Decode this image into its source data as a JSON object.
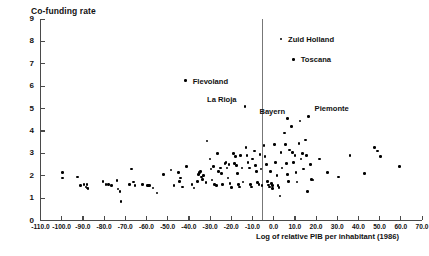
{
  "chart_data": {
    "type": "scatter",
    "title": "",
    "xlabel": "Log of relative PIB per inhabitant (1986)",
    "ylabel": "Co-funding rate",
    "xlim": [
      -110.0,
      70.0
    ],
    "ylim": [
      0,
      9
    ],
    "grid": false,
    "legend": null,
    "xticks": [
      "-110.0",
      "-100.0",
      "-90.0",
      "-80.0",
      "-70.0",
      "-60.0",
      "-50.0",
      "-40.0",
      "-30.0",
      "-20.0",
      "-10.0",
      "0.0",
      "10.0",
      "20.0",
      "30.0",
      "40.0",
      "50.0",
      "60.0",
      "70.0"
    ],
    "xtick_values": [
      -110,
      -100,
      -90,
      -80,
      -70,
      -60,
      -50,
      -40,
      -30,
      -20,
      -10,
      0,
      10,
      20,
      30,
      40,
      50,
      60,
      70
    ],
    "yticks": [
      "0",
      "1",
      "2",
      "3",
      "4",
      "5",
      "6",
      "7",
      "8",
      "9"
    ],
    "ytick_values": [
      0,
      1,
      2,
      3,
      4,
      5,
      6,
      7,
      8,
      9
    ],
    "reference_line_x": 0.0,
    "annotations": [
      {
        "label": "Zuid Holland",
        "x": 3.5,
        "y": 8.1,
        "label_dx": 7,
        "label_dy": -4
      },
      {
        "label": "Toscana",
        "x": 9.5,
        "y": 7.2,
        "label_dx": 7,
        "label_dy": -4
      },
      {
        "label": "Flevoland",
        "x": -41.5,
        "y": 6.25,
        "label_dx": 7,
        "label_dy": -4
      },
      {
        "label": "La Rioja",
        "x": -13.5,
        "y": 5.1,
        "label_dx": -38,
        "label_dy": -11
      },
      {
        "label": "Bayern",
        "x": 6.5,
        "y": 4.55,
        "label_dx": -28,
        "label_dy": -12
      },
      {
        "label": "Piemonte",
        "x": 16.5,
        "y": 4.65,
        "label_dx": 6,
        "label_dy": -12
      }
    ],
    "points": [
      {
        "x": -99.5,
        "y": 2.15
      },
      {
        "x": -99.5,
        "y": 1.9
      },
      {
        "x": -92.5,
        "y": 1.95
      },
      {
        "x": -91.0,
        "y": 1.55
      },
      {
        "x": -89.5,
        "y": 1.6
      },
      {
        "x": -88.5,
        "y": 1.5
      },
      {
        "x": -88.0,
        "y": 1.45
      },
      {
        "x": -88.0,
        "y": 1.6
      },
      {
        "x": -87.5,
        "y": 1.42
      },
      {
        "x": -80.5,
        "y": 1.75
      },
      {
        "x": -79.0,
        "y": 1.6
      },
      {
        "x": -78.0,
        "y": 1.62
      },
      {
        "x": -76.5,
        "y": 1.55
      },
      {
        "x": -74.0,
        "y": 1.78
      },
      {
        "x": -73.5,
        "y": 1.4
      },
      {
        "x": -72.5,
        "y": 1.3
      },
      {
        "x": -72.0,
        "y": 0.85
      },
      {
        "x": -68.0,
        "y": 1.6
      },
      {
        "x": -67.0,
        "y": 2.3
      },
      {
        "x": -66.0,
        "y": 1.72
      },
      {
        "x": -65.5,
        "y": 1.55
      },
      {
        "x": -62.0,
        "y": 1.62
      },
      {
        "x": -59.5,
        "y": 1.55
      },
      {
        "x": -59.0,
        "y": 1.55
      },
      {
        "x": -58.5,
        "y": 1.56
      },
      {
        "x": -57.0,
        "y": 1.45
      },
      {
        "x": -55.0,
        "y": 1.22
      },
      {
        "x": -52.0,
        "y": 2.05
      },
      {
        "x": -48.5,
        "y": 2.25
      },
      {
        "x": -47.0,
        "y": 1.55
      },
      {
        "x": -45.0,
        "y": 2.15
      },
      {
        "x": -44.5,
        "y": 1.75
      },
      {
        "x": -44.0,
        "y": 1.9
      },
      {
        "x": -43.0,
        "y": 1.5
      },
      {
        "x": -41.0,
        "y": 2.4
      },
      {
        "x": -38.5,
        "y": 1.6
      },
      {
        "x": -37.5,
        "y": 1.45
      },
      {
        "x": -36.0,
        "y": 1.75
      },
      {
        "x": -35.5,
        "y": 2.05
      },
      {
        "x": -35.0,
        "y": 2.15
      },
      {
        "x": -34.5,
        "y": 2.2
      },
      {
        "x": -34.0,
        "y": 1.95
      },
      {
        "x": -33.5,
        "y": 1.82
      },
      {
        "x": -33.0,
        "y": 2.0
      },
      {
        "x": -32.0,
        "y": 1.7
      },
      {
        "x": -31.5,
        "y": 3.55
      },
      {
        "x": -30.0,
        "y": 2.75
      },
      {
        "x": -29.5,
        "y": 2.3
      },
      {
        "x": -29.0,
        "y": 1.8
      },
      {
        "x": -28.5,
        "y": 2.4
      },
      {
        "x": -28.0,
        "y": 1.62
      },
      {
        "x": -27.0,
        "y": 1.55
      },
      {
        "x": -26.5,
        "y": 3.0
      },
      {
        "x": -26.0,
        "y": 2.2
      },
      {
        "x": -25.0,
        "y": 2.35
      },
      {
        "x": -24.5,
        "y": 2.1
      },
      {
        "x": -24.0,
        "y": 1.62
      },
      {
        "x": -23.0,
        "y": 2.55
      },
      {
        "x": -22.5,
        "y": 2.6
      },
      {
        "x": -22.0,
        "y": 2.35
      },
      {
        "x": -21.5,
        "y": 1.9
      },
      {
        "x": -21.0,
        "y": 2.5
      },
      {
        "x": -20.5,
        "y": 1.65
      },
      {
        "x": -20.0,
        "y": 1.48
      },
      {
        "x": -19.0,
        "y": 3.0
      },
      {
        "x": -18.5,
        "y": 2.55
      },
      {
        "x": -18.0,
        "y": 2.85
      },
      {
        "x": -17.5,
        "y": 2.45
      },
      {
        "x": -17.0,
        "y": 2.1
      },
      {
        "x": -16.5,
        "y": 1.62
      },
      {
        "x": -16.0,
        "y": 1.5
      },
      {
        "x": -15.5,
        "y": 2.9
      },
      {
        "x": -15.0,
        "y": 2.35
      },
      {
        "x": -14.5,
        "y": 1.72
      },
      {
        "x": -13.0,
        "y": 3.25
      },
      {
        "x": -12.5,
        "y": 2.9
      },
      {
        "x": -12.0,
        "y": 2.6
      },
      {
        "x": -11.5,
        "y": 2.35
      },
      {
        "x": -11.0,
        "y": 1.6
      },
      {
        "x": -10.5,
        "y": 1.5
      },
      {
        "x": -10.0,
        "y": 2.75
      },
      {
        "x": -9.0,
        "y": 3.1
      },
      {
        "x": -8.5,
        "y": 2.45
      },
      {
        "x": -8.0,
        "y": 2.2
      },
      {
        "x": -7.5,
        "y": 1.7
      },
      {
        "x": -7.0,
        "y": 1.6
      },
      {
        "x": -6.5,
        "y": 2.95
      },
      {
        "x": -6.0,
        "y": 2.3
      },
      {
        "x": -5.5,
        "y": 1.55
      },
      {
        "x": -4.5,
        "y": 3.35
      },
      {
        "x": -4.0,
        "y": 2.85
      },
      {
        "x": -3.5,
        "y": 2.5
      },
      {
        "x": -3.0,
        "y": 1.75
      },
      {
        "x": -2.5,
        "y": 1.58
      },
      {
        "x": -2.0,
        "y": 1.5
      },
      {
        "x": -1.5,
        "y": 2.2
      },
      {
        "x": -1.0,
        "y": 1.65
      },
      {
        "x": -0.5,
        "y": 1.55
      },
      {
        "x": -0.5,
        "y": 1.42
      },
      {
        "x": 0.5,
        "y": 3.4
      },
      {
        "x": 1.0,
        "y": 2.6
      },
      {
        "x": 1.5,
        "y": 2.0
      },
      {
        "x": 2.0,
        "y": 1.55
      },
      {
        "x": 2.5,
        "y": 1.48
      },
      {
        "x": 3.0,
        "y": 1.1
      },
      {
        "x": 3.5,
        "y": 3.05
      },
      {
        "x": 4.0,
        "y": 2.35
      },
      {
        "x": 5.0,
        "y": 3.9
      },
      {
        "x": 5.5,
        "y": 3.4
      },
      {
        "x": 6.0,
        "y": 2.55
      },
      {
        "x": 6.5,
        "y": 2.05
      },
      {
        "x": 7.0,
        "y": 1.75
      },
      {
        "x": 7.5,
        "y": 3.15
      },
      {
        "x": 8.5,
        "y": 4.2
      },
      {
        "x": 9.0,
        "y": 3.05
      },
      {
        "x": 9.5,
        "y": 2.6
      },
      {
        "x": 10.0,
        "y": 2.9
      },
      {
        "x": 10.5,
        "y": 2.15
      },
      {
        "x": 11.0,
        "y": 1.72
      },
      {
        "x": 12.0,
        "y": 3.45
      },
      {
        "x": 12.5,
        "y": 4.45
      },
      {
        "x": 13.0,
        "y": 2.75
      },
      {
        "x": 13.5,
        "y": 3.0
      },
      {
        "x": 14.0,
        "y": 2.3
      },
      {
        "x": 15.0,
        "y": 3.6
      },
      {
        "x": 15.5,
        "y": 2.9
      },
      {
        "x": 16.0,
        "y": 1.3
      },
      {
        "x": 17.5,
        "y": 2.5
      },
      {
        "x": 18.0,
        "y": 1.82
      },
      {
        "x": 18.5,
        "y": 1.8
      },
      {
        "x": 21.5,
        "y": 2.75
      },
      {
        "x": 25.5,
        "y": 2.15
      },
      {
        "x": 30.5,
        "y": 1.95
      },
      {
        "x": 36.0,
        "y": 2.9
      },
      {
        "x": 43.0,
        "y": 2.1
      },
      {
        "x": 47.5,
        "y": 3.25
      },
      {
        "x": 49.0,
        "y": 3.1
      },
      {
        "x": 50.5,
        "y": 2.85
      },
      {
        "x": 59.5,
        "y": 2.4
      }
    ]
  }
}
